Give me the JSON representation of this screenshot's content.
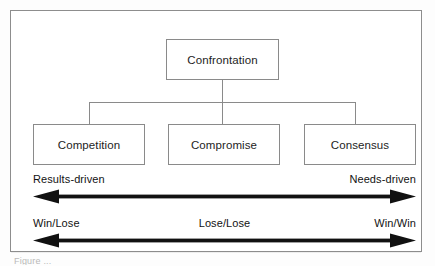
{
  "figure": {
    "caption_sliver": "Figure ..."
  },
  "colors": {
    "box_border": "#8a8a8a",
    "frame_border": "#8d8d8d",
    "arrow": "#111111",
    "text": "#1d1d1d",
    "background": "#ffffff"
  },
  "tree": {
    "root": {
      "label": "Confrontation"
    },
    "children": [
      {
        "label": "Competition"
      },
      {
        "label": "Compromise"
      },
      {
        "label": "Consensus"
      }
    ]
  },
  "spectrums": [
    {
      "name": "driver-spectrum",
      "left_label": "Results-driven",
      "center_label": "",
      "right_label": "Needs-driven",
      "arrow": "double-headed"
    },
    {
      "name": "outcome-spectrum",
      "left_label": "Win/Lose",
      "center_label": "Lose/Lose",
      "right_label": "Win/Win",
      "arrow": "double-headed"
    }
  ]
}
